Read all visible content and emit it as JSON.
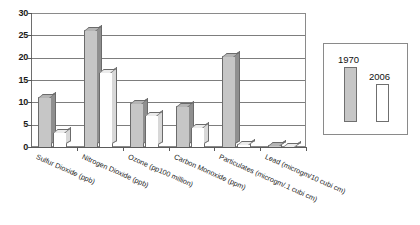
{
  "chart_data": {
    "type": "bar",
    "title": "",
    "xlabel": "",
    "ylabel": "",
    "ylim": [
      0,
      30
    ],
    "yticks": [
      "0",
      "5",
      "10",
      "15",
      "20",
      "25",
      "30"
    ],
    "grid": true,
    "legend_position": "right",
    "categories": [
      "Sulfur Dioxide (ppb)",
      "Nitrogen Dioxide (ppb)",
      "Ozone (pp100 million)",
      "Carbon Monoxide (ppm)",
      "Particulates (microgm/.1 cubi cm)",
      "Lead (microgm/10 cubi cm)"
    ],
    "series": [
      {
        "name": "1970",
        "color": "#c6c6c6",
        "values": [
          11.5,
          26.5,
          10.0,
          9.5,
          20.5,
          0.7
        ]
      },
      {
        "name": "2006",
        "color": "#ffffff",
        "values": [
          3.5,
          17.0,
          7.5,
          4.7,
          1.0,
          0.4
        ]
      }
    ]
  },
  "legend": {
    "items": [
      {
        "label": "1970"
      },
      {
        "label": "2006"
      }
    ]
  }
}
